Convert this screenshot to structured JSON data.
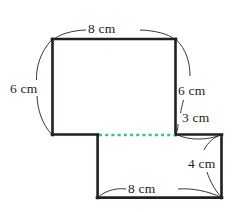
{
  "figure": {
    "units": "cm",
    "colors": {
      "outline": "#231f20",
      "dashed_divider": "#3dbf94",
      "label_text": "#1c1c1c",
      "background": "#ffffff"
    },
    "labels": {
      "top": "8 cm",
      "left": "6 cm",
      "right_upper": "6 cm",
      "right_middle": "3 cm",
      "right_lower": "4 cm",
      "bottom": "8 cm"
    },
    "shapes": {
      "upper_rectangle": {
        "name": "upper-rectangle",
        "width_label": "8 cm",
        "height_label": "6 cm",
        "x": 52,
        "y": 39,
        "w": 124,
        "h": 96
      },
      "lower_rectangle": {
        "name": "lower-rectangle",
        "width_label": "8 cm",
        "height_label": "4 cm",
        "x": 97,
        "y": 135,
        "w": 125,
        "h": 63
      },
      "divider": {
        "name": "dashed-divider",
        "x1": 98,
        "y1": 135,
        "x2": 176,
        "y2": 135
      }
    }
  }
}
